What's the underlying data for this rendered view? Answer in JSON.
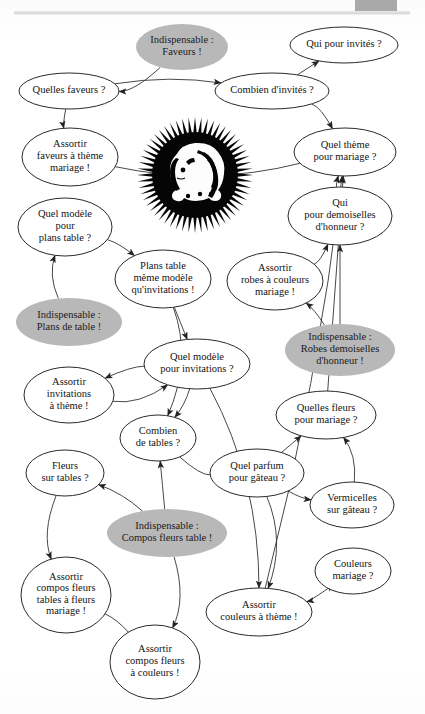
{
  "page": {
    "language": "fr",
    "artifacts": {
      "top_rule": "scanned-page-top-rule",
      "corner_block": "gray-corner-block"
    }
  },
  "legend": {
    "normal_node": "Question ou tâche (ellipse blanche, contour noir)",
    "highlight_node": "Élément indispensable (ellipse grise pleine)",
    "highlight_color": "#b8b8b8",
    "node_fill": "#ffffff",
    "node_stroke": "#2a2a2a",
    "edge_color": "#333333"
  },
  "decoration": {
    "sunburst": {
      "name": "sunburst-face-emblem",
      "description": "Soleil noir à rayons pointus avec visage de femme de profil",
      "cx": 195,
      "cy": 175,
      "r": 57,
      "color": "#050505"
    }
  },
  "chart_data": {
    "type": "diagram-graph",
    "node_count": 24,
    "edge_count": 39,
    "nodes": [
      {
        "id": "indisp_faveurs",
        "label": [
          "Indispensable :",
          "Faveurs !"
        ],
        "kind": "highlight",
        "cx": 182,
        "cy": 47,
        "rx": 46,
        "ry": 23
      },
      {
        "id": "quelles_faveurs",
        "label": [
          "Quelles faveurs ?"
        ],
        "kind": "normal",
        "cx": 69,
        "cy": 91,
        "rx": 50,
        "ry": 18
      },
      {
        "id": "combien_invites",
        "label": [
          "Combien d'invités ?"
        ],
        "kind": "normal",
        "cx": 272,
        "cy": 91,
        "rx": 57,
        "ry": 18
      },
      {
        "id": "qui_invites",
        "label": [
          "Qui pour invités ?"
        ],
        "kind": "normal",
        "cx": 344,
        "cy": 45,
        "rx": 54,
        "ry": 18
      },
      {
        "id": "assortir_faveurs",
        "label": [
          "Assortir",
          "faveurs à thème",
          "mariage !"
        ],
        "kind": "normal",
        "cx": 70,
        "cy": 157,
        "rx": 48,
        "ry": 29
      },
      {
        "id": "quel_theme",
        "label": [
          "Quel thème",
          "pour mariage ?"
        ],
        "kind": "normal",
        "cx": 345,
        "cy": 152,
        "rx": 51,
        "ry": 24
      },
      {
        "id": "qui_demoiselles",
        "label": [
          "Qui",
          "pour demoiselles",
          "d'honneur ?"
        ],
        "kind": "normal",
        "cx": 340,
        "cy": 216,
        "rx": 52,
        "ry": 29
      },
      {
        "id": "quel_modele_plans",
        "label": [
          "Quel modèle",
          "pour",
          "plans table ?"
        ],
        "kind": "normal",
        "cx": 65,
        "cy": 227,
        "rx": 47,
        "ry": 29
      },
      {
        "id": "plans_table_modele",
        "label": [
          "Plans table",
          "même modèle",
          "qu'invitations !"
        ],
        "kind": "normal",
        "cx": 163,
        "cy": 279,
        "rx": 48,
        "ry": 29
      },
      {
        "id": "assortir_robes",
        "label": [
          "Assortir",
          "robes à couleurs",
          "mariage !"
        ],
        "kind": "normal",
        "cx": 275,
        "cy": 281,
        "rx": 48,
        "ry": 29
      },
      {
        "id": "indisp_plans",
        "label": [
          "Indispensable :",
          "Plans de table !"
        ],
        "kind": "highlight",
        "cx": 69,
        "cy": 322,
        "rx": 53,
        "ry": 24
      },
      {
        "id": "indisp_robes",
        "label": [
          "Indispensable :",
          "Robes demoiselles",
          "d'honneur !"
        ],
        "kind": "highlight",
        "cx": 340,
        "cy": 350,
        "rx": 55,
        "ry": 26
      },
      {
        "id": "quel_modele_invit",
        "label": [
          "Quel modèle",
          "pour invitations ?"
        ],
        "kind": "normal",
        "cx": 197,
        "cy": 364,
        "rx": 53,
        "ry": 25
      },
      {
        "id": "assortir_invitations",
        "label": [
          "Assortir",
          "invitations",
          "à thème !"
        ],
        "kind": "normal",
        "cx": 69,
        "cy": 395,
        "rx": 45,
        "ry": 28
      },
      {
        "id": "quelles_fleurs",
        "label": [
          "Quelles fleurs",
          "pour mariage ?"
        ],
        "kind": "normal",
        "cx": 326,
        "cy": 415,
        "rx": 50,
        "ry": 24
      },
      {
        "id": "combien_tables",
        "label": [
          "Combien",
          "de tables ?"
        ],
        "kind": "normal",
        "cx": 158,
        "cy": 438,
        "rx": 38,
        "ry": 23
      },
      {
        "id": "quel_parfum",
        "label": [
          "Quel parfum",
          "pour gâteau ?"
        ],
        "kind": "normal",
        "cx": 257,
        "cy": 473,
        "rx": 47,
        "ry": 24
      },
      {
        "id": "fleurs_sur_tables",
        "label": [
          "Fleurs",
          "sur tables ?"
        ],
        "kind": "normal",
        "cx": 65,
        "cy": 473,
        "rx": 39,
        "ry": 23
      },
      {
        "id": "vermicelles",
        "label": [
          "Vermicelles",
          "sur gâteau ?"
        ],
        "kind": "normal",
        "cx": 352,
        "cy": 505,
        "rx": 42,
        "ry": 23
      },
      {
        "id": "indisp_compos",
        "label": [
          "Indispensable :",
          "Compos fleurs table !"
        ],
        "kind": "highlight",
        "cx": 167,
        "cy": 533,
        "rx": 60,
        "ry": 24
      },
      {
        "id": "couleurs_mariage",
        "label": [
          "Couleurs",
          "mariage ?"
        ],
        "kind": "normal",
        "cx": 353,
        "cy": 571,
        "rx": 38,
        "ry": 23
      },
      {
        "id": "assortir_compos_tables",
        "label": [
          "Assortir",
          "compos fleurs",
          "tables à fleurs",
          "mariage !"
        ],
        "kind": "normal",
        "cx": 66,
        "cy": 595,
        "rx": 45,
        "ry": 38
      },
      {
        "id": "assortir_couleurs",
        "label": [
          "Assortir",
          "couleurs à thème !"
        ],
        "kind": "normal",
        "cx": 259,
        "cy": 612,
        "rx": 53,
        "ry": 24
      },
      {
        "id": "assortir_compos_coul",
        "label": [
          "Assortir",
          "compos fleurs",
          "à couleurs !"
        ],
        "kind": "normal",
        "cx": 155,
        "cy": 662,
        "rx": 45,
        "ry": 37
      }
    ],
    "edges": [
      {
        "from": "indisp_faveurs",
        "to": "quelles_faveurs",
        "arrow": "end"
      },
      {
        "from": "quelles_faveurs",
        "to": "combien_invites",
        "arrow": "end"
      },
      {
        "from": "combien_invites",
        "to": "qui_invites",
        "arrow": "end"
      },
      {
        "from": "quelles_faveurs",
        "to": "assortir_faveurs",
        "arrow": "end"
      },
      {
        "from": "assortir_faveurs",
        "to": "quel_theme",
        "arrow": "none"
      },
      {
        "from": "combien_invites",
        "to": "quel_theme",
        "arrow": "end"
      },
      {
        "from": "qui_demoiselles",
        "to": "quel_theme",
        "arrow": "end"
      },
      {
        "from": "indisp_robes",
        "to": "qui_demoiselles",
        "arrow": "end"
      },
      {
        "from": "indisp_robes",
        "to": "assortir_robes",
        "arrow": "end"
      },
      {
        "from": "assortir_robes",
        "to": "qui_demoiselles",
        "arrow": "end"
      },
      {
        "from": "indisp_plans",
        "to": "quel_modele_plans",
        "arrow": "end"
      },
      {
        "from": "quel_modele_plans",
        "to": "plans_table_modele",
        "arrow": "end"
      },
      {
        "from": "plans_table_modele",
        "to": "quel_modele_invit",
        "arrow": "end"
      },
      {
        "from": "quel_modele_invit",
        "to": "assortir_invitations",
        "arrow": "end"
      },
      {
        "from": "assortir_invitations",
        "to": "quel_modele_invit",
        "arrow": "end"
      },
      {
        "from": "plans_table_modele",
        "to": "combien_tables",
        "arrow": "end"
      },
      {
        "from": "quel_modele_invit",
        "to": "combien_tables",
        "arrow": "end"
      },
      {
        "from": "indisp_compos",
        "to": "combien_tables",
        "arrow": "end"
      },
      {
        "from": "indisp_compos",
        "to": "fleurs_sur_tables",
        "arrow": "end"
      },
      {
        "from": "fleurs_sur_tables",
        "to": "assortir_compos_tables",
        "arrow": "end"
      },
      {
        "from": "indisp_compos",
        "to": "assortir_compos_coul",
        "arrow": "end"
      },
      {
        "from": "assortir_compos_tables",
        "to": "assortir_compos_coul",
        "arrow": "none"
      },
      {
        "from": "quel_parfum",
        "to": "quelles_fleurs",
        "arrow": "end"
      },
      {
        "from": "quel_parfum",
        "to": "vermicelles",
        "arrow": "end"
      },
      {
        "from": "vermicelles",
        "to": "quelles_fleurs",
        "arrow": "end"
      },
      {
        "from": "quel_parfum",
        "to": "assortir_couleurs",
        "arrow": "end"
      },
      {
        "from": "couleurs_mariage",
        "to": "assortir_couleurs",
        "arrow": "both"
      },
      {
        "from": "quelles_fleurs",
        "to": "quel_theme",
        "arrow": "end"
      },
      {
        "from": "assortir_couleurs",
        "to": "quel_theme",
        "arrow": "end"
      },
      {
        "from": "combien_tables",
        "to": "quel_parfum",
        "arrow": "none"
      },
      {
        "from": "quel_modele_invit",
        "to": "assortir_couleurs",
        "arrow": "end"
      }
    ]
  }
}
